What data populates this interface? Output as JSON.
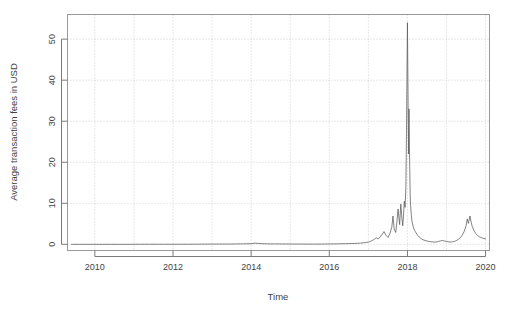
{
  "figure": {
    "background_color": "#ffffff",
    "frame_color": "#9a9a9a",
    "grid_color": "#bdbdbd",
    "series_color": "#5a5a5a"
  },
  "chart_data": {
    "type": "line",
    "title": "",
    "xlabel": "Time",
    "ylabel": "Average transaction fees in USD",
    "xlim": [
      2009.3,
      2020.1
    ],
    "ylim": [
      -1.5,
      56
    ],
    "grid": true,
    "legend": false,
    "legend_position": "none",
    "xticks": [
      2010,
      2012,
      2014,
      2016,
      2018,
      2020
    ],
    "xtick_labels": [
      "2010",
      "2012",
      "2014",
      "2016",
      "2018",
      "2020"
    ],
    "yticks": [
      0,
      10,
      20,
      30,
      40,
      50
    ],
    "ytick_labels": [
      "0",
      "10",
      "20",
      "30",
      "40",
      "50"
    ],
    "x_minor_gridlines": [
      2010,
      2011,
      2012,
      2013,
      2014,
      2015,
      2016,
      2017,
      2018,
      2019,
      2020
    ],
    "series": [
      {
        "name": "Average transaction fees in USD",
        "x": [
          2009.4,
          2009.6,
          2009.8,
          2010.0,
          2010.2,
          2010.4,
          2010.6,
          2010.8,
          2011.0,
          2011.2,
          2011.4,
          2011.6,
          2011.8,
          2012.0,
          2012.2,
          2012.4,
          2012.6,
          2012.8,
          2013.0,
          2013.2,
          2013.4,
          2013.6,
          2013.8,
          2014.0,
          2014.1,
          2014.2,
          2014.4,
          2014.6,
          2014.8,
          2015.0,
          2015.2,
          2015.4,
          2015.6,
          2015.8,
          2016.0,
          2016.2,
          2016.4,
          2016.6,
          2016.8,
          2016.9,
          2017.0,
          2017.05,
          2017.1,
          2017.15,
          2017.2,
          2017.25,
          2017.3,
          2017.35,
          2017.4,
          2017.45,
          2017.5,
          2017.55,
          2017.6,
          2017.63,
          2017.66,
          2017.7,
          2017.73,
          2017.76,
          2017.8,
          2017.83,
          2017.86,
          2017.88,
          2017.9,
          2017.92,
          2017.94,
          2017.96,
          2017.97,
          2017.98,
          2017.99,
          2018.0,
          2018.01,
          2018.02,
          2018.03,
          2018.04,
          2018.05,
          2018.06,
          2018.07,
          2018.08,
          2018.1,
          2018.12,
          2018.15,
          2018.18,
          2018.22,
          2018.26,
          2018.3,
          2018.35,
          2018.4,
          2018.45,
          2018.5,
          2018.55,
          2018.6,
          2018.65,
          2018.7,
          2018.75,
          2018.8,
          2018.85,
          2018.9,
          2018.95,
          2019.0,
          2019.05,
          2019.1,
          2019.15,
          2019.2,
          2019.25,
          2019.3,
          2019.35,
          2019.4,
          2019.45,
          2019.5,
          2019.53,
          2019.56,
          2019.6,
          2019.63,
          2019.66,
          2019.7,
          2019.75,
          2019.8,
          2019.85,
          2019.9,
          2019.95,
          2020.0
        ],
        "y": [
          0.0,
          0.0,
          0.0,
          0.0,
          0.0,
          0.0,
          0.0,
          0.0,
          0.01,
          0.02,
          0.03,
          0.02,
          0.02,
          0.02,
          0.03,
          0.03,
          0.04,
          0.05,
          0.06,
          0.08,
          0.07,
          0.09,
          0.12,
          0.15,
          0.3,
          0.2,
          0.12,
          0.1,
          0.09,
          0.08,
          0.07,
          0.06,
          0.06,
          0.07,
          0.09,
          0.12,
          0.16,
          0.2,
          0.3,
          0.4,
          0.55,
          0.7,
          0.95,
          1.2,
          1.6,
          1.3,
          1.8,
          2.4,
          3.1,
          2.2,
          1.7,
          2.6,
          4.2,
          6.9,
          3.8,
          2.9,
          5.4,
          8.6,
          4.8,
          9.8,
          6.2,
          4.5,
          7.1,
          10.5,
          9.0,
          14.0,
          22.0,
          32.0,
          44.0,
          54.0,
          42.0,
          31.0,
          22.0,
          33.0,
          24.0,
          18.0,
          12.0,
          9.5,
          7.0,
          5.4,
          4.2,
          3.4,
          2.8,
          2.2,
          1.8,
          1.4,
          1.1,
          0.95,
          0.8,
          0.7,
          0.62,
          0.58,
          0.55,
          0.6,
          0.7,
          0.85,
          0.95,
          0.8,
          0.7,
          0.62,
          0.58,
          0.6,
          0.7,
          0.9,
          1.2,
          1.6,
          2.2,
          3.1,
          4.5,
          6.2,
          5.1,
          6.9,
          5.4,
          4.3,
          3.4,
          2.6,
          2.1,
          1.8,
          1.6,
          1.45,
          1.35
        ]
      }
    ],
    "annotations": {
      "peak_value": 54,
      "peak_x": 2018.0,
      "secondary_peak_value": 33,
      "quiet_period": "2009-2016 near zero",
      "secondary_bump_value": 6.9,
      "secondary_bump_x": 2019.6
    }
  },
  "axis": {
    "x_title": "Time",
    "y_title": "Average transaction fees in USD"
  }
}
